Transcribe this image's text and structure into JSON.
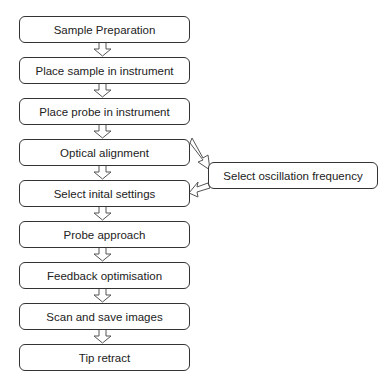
{
  "diagram": {
    "type": "flowchart",
    "steps": [
      {
        "label": "Sample Preparation"
      },
      {
        "label": "Place sample in instrument"
      },
      {
        "label": "Place probe in instrument"
      },
      {
        "label": "Optical alignment"
      },
      {
        "label": "Select inital settings"
      },
      {
        "label": "Probe approach"
      },
      {
        "label": "Feedback optimisation"
      },
      {
        "label": "Scan and save images"
      },
      {
        "label": "Tip retract"
      }
    ],
    "side_step": {
      "label": "Select oscillation frequency",
      "from": "Optical alignment",
      "to": "Select inital settings"
    },
    "colors": {
      "stroke": "#333333",
      "fill": "#ffffff",
      "text": "#222222"
    }
  }
}
